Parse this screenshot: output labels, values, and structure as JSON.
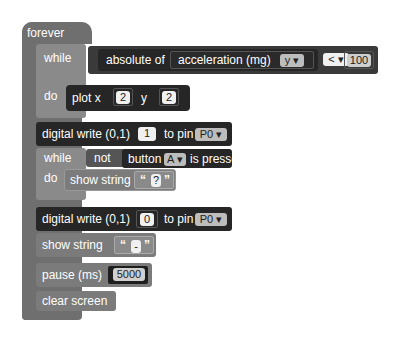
{
  "forever": {
    "label": "forever"
  },
  "while1": {
    "while_label": "while",
    "do_label": "do",
    "condition": {
      "func": "absolute of",
      "sensor": "acceleration (mg)",
      "axis": "y ▾",
      "operator": "< ▾",
      "value": "100"
    },
    "body": {
      "plot": "plot x",
      "x": "2",
      "y_label": "y",
      "y": "2"
    }
  },
  "dw1": {
    "label": "digital write (0,1)",
    "value": "1",
    "to_pin": "to pin",
    "pin": "P0 ▾"
  },
  "while2": {
    "while_label": "while",
    "do_label": "do",
    "not_label": "not",
    "button_label": "button",
    "button": "A ▾",
    "pressed": "is pressed",
    "body": {
      "label": "show string",
      "open_quote": "“",
      "text": "?",
      "close_quote": "”"
    }
  },
  "dw2": {
    "label": "digital write (0,1)",
    "value": "0",
    "to_pin": "to pin",
    "pin": "P0 ▾"
  },
  "show2": {
    "label": "show string",
    "open_quote": "“",
    "text": "-",
    "close_quote": "”"
  },
  "pause": {
    "label": "pause (ms)",
    "value": "5000"
  },
  "clear": {
    "label": "clear screen"
  }
}
